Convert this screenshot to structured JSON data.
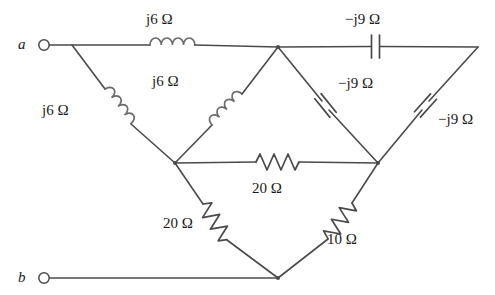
{
  "figure": {
    "kind": "ac-circuit-schematic",
    "background_color": "#ffffff",
    "wire_color": "#4a4a4a",
    "text_color": "#1a1a1a"
  },
  "terminals": [
    {
      "id": "a",
      "label": "a",
      "x": 44,
      "y": 45
    },
    {
      "id": "b",
      "label": "b",
      "x": 44,
      "y": 278
    }
  ],
  "labels": {
    "top_inductor": "j6 Ω",
    "left_inductor": "j6 Ω",
    "inner_inductor": "j6 Ω",
    "top_capacitor": "−j9 Ω",
    "inner_capacitor": "−j9 Ω",
    "right_capacitor": "−j9 Ω",
    "middle_resistor": "20 Ω",
    "left_resistor": "20 Ω",
    "right_resistor": "10 Ω"
  },
  "components": [
    {
      "name": "top-inductor",
      "type": "inductor",
      "value": "j6 Ω",
      "from": "a",
      "to": "top-mid",
      "orientation": "horizontal"
    },
    {
      "name": "top-capacitor",
      "type": "capacitor",
      "value": "−j9 Ω",
      "from": "top-mid",
      "to": "top-right",
      "orientation": "horizontal"
    },
    {
      "name": "left-inductor",
      "type": "inductor",
      "value": "j6 Ω",
      "from": "a",
      "to": "left-mid",
      "orientation": "diagonal"
    },
    {
      "name": "inner-inductor",
      "type": "inductor",
      "value": "j6 Ω",
      "from": "left-mid",
      "to": "top-mid",
      "orientation": "diagonal"
    },
    {
      "name": "inner-capacitor",
      "type": "capacitor",
      "value": "−j9 Ω",
      "from": "top-mid",
      "to": "right-mid",
      "orientation": "diagonal"
    },
    {
      "name": "right-capacitor",
      "type": "capacitor",
      "value": "−j9 Ω",
      "from": "top-right",
      "to": "right-mid",
      "orientation": "diagonal"
    },
    {
      "name": "middle-resistor",
      "type": "resistor",
      "value": "20 Ω",
      "from": "left-mid",
      "to": "right-mid",
      "orientation": "horizontal"
    },
    {
      "name": "left-resistor",
      "type": "resistor",
      "value": "20 Ω",
      "from": "left-mid",
      "to": "bottom",
      "orientation": "diagonal"
    },
    {
      "name": "right-resistor",
      "type": "resistor",
      "value": "10 Ω",
      "from": "right-mid",
      "to": "bottom",
      "orientation": "diagonal"
    }
  ],
  "nodes": [
    {
      "id": "a",
      "x": 72,
      "y": 45
    },
    {
      "id": "top-mid",
      "x": 278,
      "y": 47
    },
    {
      "id": "top-right",
      "x": 478,
      "y": 47
    },
    {
      "id": "left-mid",
      "x": 175,
      "y": 163
    },
    {
      "id": "right-mid",
      "x": 378,
      "y": 163
    },
    {
      "id": "bottom",
      "x": 278,
      "y": 278
    }
  ],
  "label_positions": {
    "top_inductor": {
      "x": 146,
      "y": 12
    },
    "top_capacitor": {
      "x": 345,
      "y": 12
    },
    "left_inductor": {
      "x": 42,
      "y": 103
    },
    "inner_inductor": {
      "x": 152,
      "y": 74
    },
    "inner_capacitor": {
      "x": 338,
      "y": 76
    },
    "right_capacitor": {
      "x": 438,
      "y": 112
    },
    "middle_resistor": {
      "x": 252,
      "y": 181
    },
    "left_resistor": {
      "x": 163,
      "y": 216
    },
    "right_resistor": {
      "x": 327,
      "y": 232
    }
  }
}
